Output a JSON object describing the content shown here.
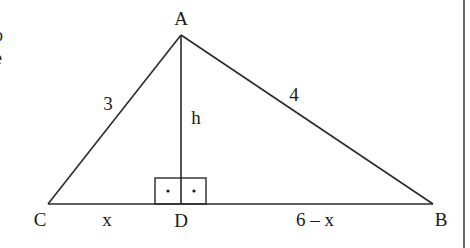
{
  "diagram": {
    "type": "right-triangle-with-altitude",
    "vertices": [
      {
        "id": "A",
        "label": "A"
      },
      {
        "id": "B",
        "label": "B"
      },
      {
        "id": "C",
        "label": "C"
      },
      {
        "id": "D",
        "label": "D"
      }
    ],
    "sides": {
      "AC": "3",
      "AB": "4",
      "AD": "h",
      "CD": "x",
      "DB": "6 – x"
    },
    "right_angle_marker": "AD ⟂ CB",
    "edge_text": [
      "o",
      "e"
    ],
    "colors": {
      "line": "#2a2a2a",
      "background": "#ffffff"
    }
  }
}
